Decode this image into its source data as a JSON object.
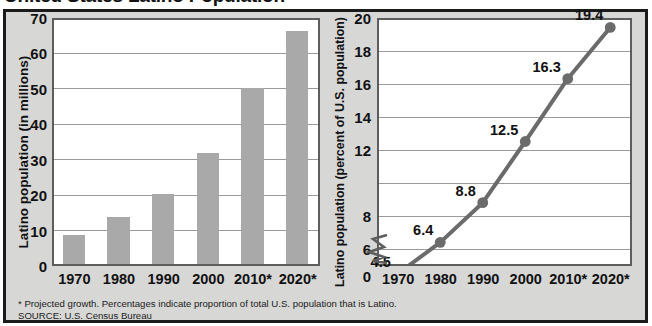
{
  "figure": {
    "title_cropped": "United States Latino Population",
    "footnote_line1": "* Projected growth. Percentages indicate proportion of total U.S. population that is Latino.",
    "footnote_line2": "SOURCE: U.S. Census Bureau",
    "panel_background": "#d7d7d6",
    "bar_color": "#a9a9a9",
    "line_color": "#6b6b6b",
    "plot_background": "#ffffff",
    "border_color": "#1b1b1b"
  },
  "chart_data": [
    {
      "type": "bar",
      "title": "",
      "xlabel": "",
      "ylabel": "Latino population (in millions)",
      "categories": [
        "1970",
        "1980",
        "1990",
        "2000",
        "2010*",
        "2020*"
      ],
      "values": [
        9,
        14,
        20.5,
        32,
        50.5,
        66.5
      ],
      "ylim": [
        0,
        70
      ],
      "yticks": [
        0,
        10,
        20,
        30,
        40,
        50,
        60,
        70
      ],
      "grid": true,
      "legend": "none"
    },
    {
      "type": "line",
      "title": "",
      "xlabel": "",
      "ylabel": "Latino population (percent of U.S. population)",
      "categories": [
        "1970",
        "1980",
        "1990",
        "2000",
        "2010*",
        "2020*"
      ],
      "values": [
        4.5,
        6.4,
        8.8,
        12.5,
        16.3,
        19.4
      ],
      "point_labels": [
        "4.5",
        "6.4",
        "8.8",
        "12.5",
        "16.3",
        "19.4"
      ],
      "ylim": [
        5,
        20
      ],
      "yticks": [
        0,
        6,
        8,
        10,
        12,
        14,
        16,
        18,
        20
      ],
      "ytick_labels_shown": [
        "0",
        "6",
        "8",
        "12",
        "14",
        "16",
        "18",
        "20"
      ],
      "axis_break": true,
      "grid": true,
      "legend": "none"
    }
  ]
}
